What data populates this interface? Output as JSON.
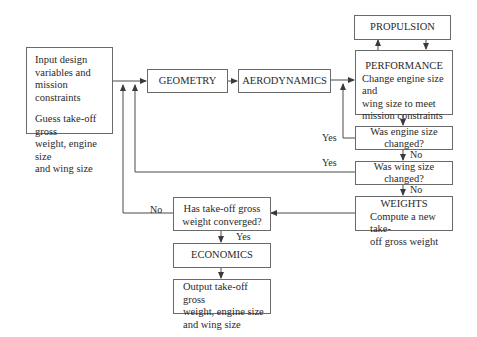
{
  "diagram": {
    "type": "flowchart",
    "nodes": {
      "input": {
        "line1": "Input design",
        "line2": "variables and",
        "line3": "mission constraints",
        "line4": "Guess take-off gross",
        "line5": "weight, engine size",
        "line6": "and wing size"
      },
      "geometry": {
        "label": "GEOMETRY"
      },
      "aerodynamics": {
        "label": "AERODYNAMICS"
      },
      "propulsion": {
        "label": "PROPULSION"
      },
      "performance": {
        "title": "PERFORMANCE",
        "line1": "Change engine size and",
        "line2": "wing size to meet",
        "line3": "mission constraints"
      },
      "engine_check": {
        "label": "Was engine size changed?"
      },
      "wing_check": {
        "label": "Was wing size changed?"
      },
      "weights": {
        "title": "WEIGHTS",
        "line1": "Compute  a new take-",
        "line2": "off gross weight"
      },
      "converged_check": {
        "line1": "Has take-off gross",
        "line2": "weight converged?"
      },
      "economics": {
        "label": "ECONOMICS"
      },
      "output": {
        "line1": "Output take-off gross",
        "line2": "weight, engine size",
        "line3": "and wing size"
      }
    },
    "edge_labels": {
      "engine_yes": "Yes",
      "engine_no": "No",
      "wing_yes": "Yes",
      "wing_no": "No",
      "converged_no": "No",
      "converged_yes": "Yes"
    },
    "colors": {
      "line": "#4a4a4a",
      "box_border": "#6a6a6a",
      "background": "#ffffff"
    }
  }
}
